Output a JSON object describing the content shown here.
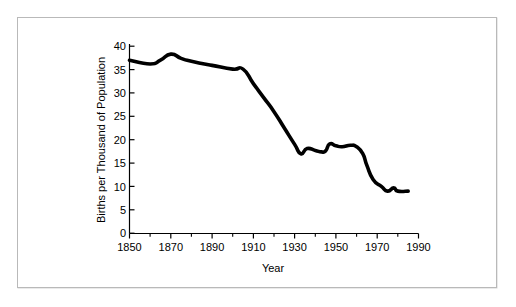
{
  "figure": {
    "background_color": "#ffffff",
    "frame_color": "#b9b9b9",
    "line_color": "#000000"
  },
  "chart_data": {
    "type": "line",
    "title": "",
    "xlabel": "Year",
    "ylabel": "Births per Thousand of Population",
    "xlim": [
      1850,
      1990
    ],
    "ylim": [
      0,
      40
    ],
    "grid": false,
    "legend": "none",
    "x_major_ticks": [
      1850,
      1870,
      1890,
      1910,
      1930,
      1950,
      1970,
      1990
    ],
    "x_major_tick_labels": [
      "1850",
      "1870",
      "1890",
      "1910",
      "1930",
      "1950",
      "1970",
      "1990"
    ],
    "x_minor_ticks": [
      1860,
      1880,
      1900,
      1920,
      1940,
      1960,
      1980
    ],
    "y_ticks": [
      0,
      5,
      10,
      15,
      20,
      25,
      30,
      35,
      40
    ],
    "y_tick_labels": [
      "0",
      "5",
      "10",
      "15",
      "20",
      "25",
      "30",
      "35",
      "40"
    ],
    "series": [
      {
        "name": "Birth rate",
        "x": [
          1850,
          1860,
          1865,
          1870,
          1875,
          1880,
          1890,
          1900,
          1905,
          1910,
          1915,
          1920,
          1925,
          1930,
          1933,
          1936,
          1940,
          1943,
          1945,
          1947,
          1950,
          1953,
          1957,
          1960,
          1963,
          1965,
          1968,
          1972,
          1975,
          1978,
          1980,
          1985
        ],
        "y": [
          37.0,
          36.2,
          37.0,
          38.3,
          37.4,
          36.8,
          35.9,
          35.1,
          35.1,
          32.0,
          29.0,
          26.0,
          22.5,
          19.0,
          17.0,
          18.1,
          17.7,
          17.4,
          17.6,
          19.1,
          18.7,
          18.5,
          18.8,
          18.5,
          17.0,
          14.5,
          11.5,
          10.0,
          9.0,
          9.7,
          9.0,
          9.0
        ]
      }
    ]
  },
  "axes": {
    "y_title": "Births per Thousand of Population",
    "x_title": "Year"
  }
}
